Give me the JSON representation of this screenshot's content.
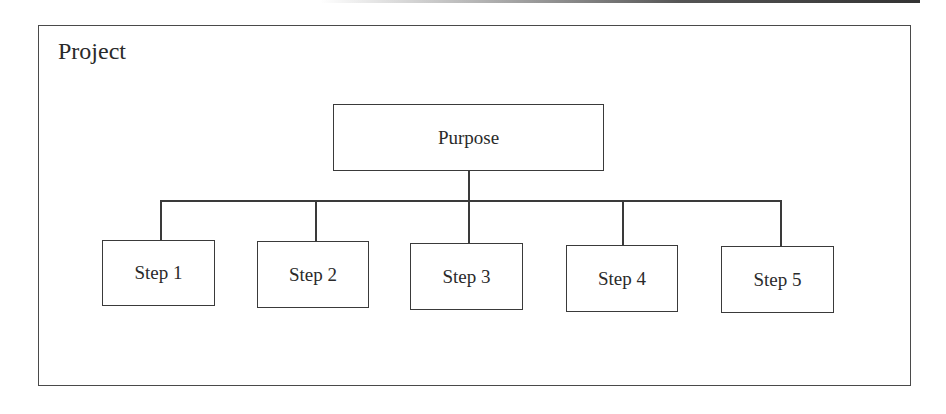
{
  "frame": {
    "title": "Project"
  },
  "root": {
    "label": "Purpose"
  },
  "steps": [
    {
      "label": "Step 1"
    },
    {
      "label": "Step 2"
    },
    {
      "label": "Step 3"
    },
    {
      "label": "Step 4"
    },
    {
      "label": "Step 5"
    }
  ],
  "colors": {
    "stroke": "#3a3a3a",
    "text": "#2a2a2a",
    "background": "#ffffff"
  }
}
